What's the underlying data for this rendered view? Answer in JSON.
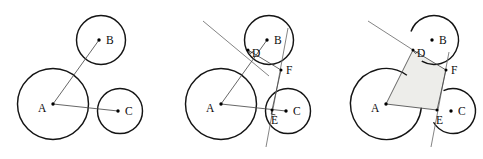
{
  "figure": {
    "width": 483,
    "height": 159,
    "background_color": "#ffffff",
    "stroke_color": "#141414",
    "line_color": "#4a4a4a",
    "shade_color": "#ededea",
    "panel_count": 3
  },
  "labels": {
    "A": "A",
    "B": "B",
    "C": "C",
    "D": "D",
    "E": "E",
    "F": "F"
  },
  "panels": [
    {
      "name": "panel-1",
      "caption": "",
      "offset_x": 0,
      "circles": [
        {
          "id": "A",
          "cx": 53,
          "cy": 104,
          "r": 35.5,
          "label": "A",
          "label_x": 38,
          "label_y": 112,
          "dot_x": 53,
          "dot_y": 104
        },
        {
          "id": "B",
          "cx": 101,
          "cy": 40,
          "r": 24.5,
          "label": "B",
          "label_x": 106,
          "label_y": 44,
          "dot_x": 99,
          "dot_y": 40
        },
        {
          "id": "C",
          "cx": 120,
          "cy": 111,
          "r": 22.5,
          "label": "C",
          "label_x": 125,
          "label_y": 115,
          "dot_x": 118,
          "dot_y": 111
        }
      ],
      "segments": [
        {
          "name": "radius-AB",
          "x1": 53,
          "y1": 104,
          "x2": 99,
          "y2": 40
        },
        {
          "name": "radius-AC",
          "x1": 53,
          "y1": 104,
          "x2": 118,
          "y2": 111
        }
      ],
      "points": [],
      "shaded": false
    },
    {
      "name": "panel-2",
      "caption": "",
      "offset_x": 168,
      "circles": [
        {
          "id": "A",
          "cx": 53,
          "cy": 104,
          "r": 35.5,
          "label": "A",
          "label_x": 38,
          "label_y": 112,
          "dot_x": 53,
          "dot_y": 104
        },
        {
          "id": "B",
          "cx": 101,
          "cy": 40,
          "r": 24.5,
          "label": "B",
          "label_x": 106,
          "label_y": 44,
          "dot_x": 99,
          "dot_y": 40
        },
        {
          "id": "C",
          "cx": 120,
          "cy": 111,
          "r": 22.5,
          "label": "C",
          "label_x": 125,
          "label_y": 115,
          "dot_x": 118,
          "dot_y": 111
        }
      ],
      "segments": [
        {
          "name": "radius-AB",
          "x1": 53,
          "y1": 104,
          "x2": 99,
          "y2": 40
        },
        {
          "name": "radius-AC",
          "x1": 53,
          "y1": 104,
          "x2": 118,
          "y2": 111
        },
        {
          "name": "chord-DF",
          "x1": 80,
          "y1": 50,
          "x2": 113,
          "y2": 70
        },
        {
          "name": "chord-FE",
          "x1": 113,
          "y1": 70,
          "x2": 104,
          "y2": 110
        }
      ],
      "construction_lines": [
        {
          "name": "tangent-line-through-D",
          "x1": 35,
          "y1": 21,
          "x2": 101,
          "y2": 76
        },
        {
          "name": "tangent-line-through-E",
          "x1": 120,
          "y1": 28,
          "x2": 98,
          "y2": 147
        }
      ],
      "points": [
        {
          "id": "D",
          "x": 80,
          "y": 50,
          "label": "D",
          "label_x": 84,
          "label_y": 57,
          "tick": true,
          "tick_angle": -35
        },
        {
          "id": "E",
          "x": 104,
          "y": 110,
          "label": "E",
          "label_x": 103,
          "label_y": 124,
          "tick": true,
          "tick_angle": 10
        },
        {
          "id": "F",
          "x": 113,
          "y": 70,
          "label": "F",
          "label_x": 118,
          "label_y": 74,
          "tick": false,
          "tick_angle": 0
        }
      ],
      "shaded": false
    },
    {
      "name": "panel-3",
      "caption": "",
      "offset_x": 333,
      "circles": [
        {
          "id": "A",
          "cx": 53,
          "cy": 104,
          "r": 35.5,
          "label": "A",
          "label_x": 38,
          "label_y": 112,
          "dot_x": 53,
          "dot_y": 104,
          "gap_start": -54,
          "gap_end": 6
        },
        {
          "id": "B",
          "cx": 101,
          "cy": 40,
          "r": 24.5,
          "label": "B",
          "label_x": 106,
          "label_y": 44,
          "dot_x": 99,
          "dot_y": 40,
          "gap_start": 120,
          "gap_end": 200
        },
        {
          "id": "C",
          "cx": 120,
          "cy": 111,
          "r": 22.5,
          "label": "C",
          "label_x": 125,
          "label_y": 115,
          "dot_x": 118,
          "dot_y": 111,
          "gap_start": 150,
          "gap_end": 245
        }
      ],
      "segments": [
        {
          "name": "edge-AD",
          "x1": 53,
          "y1": 104,
          "x2": 80,
          "y2": 50
        },
        {
          "name": "edge-AE",
          "x1": 53,
          "y1": 104,
          "x2": 104,
          "y2": 110
        },
        {
          "name": "edge-DF",
          "x1": 80,
          "y1": 50,
          "x2": 113,
          "y2": 70
        },
        {
          "name": "edge-FE",
          "x1": 113,
          "y1": 70,
          "x2": 104,
          "y2": 110
        }
      ],
      "construction_lines": [
        {
          "name": "tangent-line-through-D",
          "x1": 35,
          "y1": 21,
          "x2": 80,
          "y2": 50
        },
        {
          "name": "tangent-line-through-E",
          "x1": 116,
          "y1": 52,
          "x2": 98,
          "y2": 147
        }
      ],
      "points": [
        {
          "id": "D",
          "x": 80,
          "y": 50,
          "label": "D",
          "label_x": 84,
          "label_y": 57,
          "tick": true,
          "tick_angle": -35
        },
        {
          "id": "E",
          "x": 104,
          "y": 110,
          "label": "E",
          "label_x": 103,
          "label_y": 124,
          "tick": false,
          "tick_angle": 0
        },
        {
          "id": "F",
          "x": 113,
          "y": 70,
          "label": "F",
          "label_x": 118,
          "label_y": 74,
          "tick": false,
          "tick_angle": 0
        }
      ],
      "shaded": true,
      "shaded_polygon": "53,104 80,50 113,70 104,110"
    }
  ]
}
